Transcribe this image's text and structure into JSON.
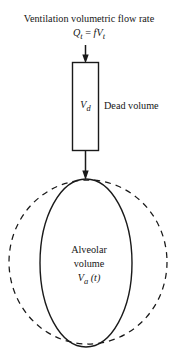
{
  "figure": {
    "title_line1": "Ventilation volumetric flow rate",
    "flow_equation": {
      "lhs_symbol": "Q",
      "lhs_subscript": "t",
      "equals": " = ",
      "rhs_freq": "f",
      "rhs_symbol": "V",
      "rhs_subscript": "t"
    },
    "dead_volume": {
      "box_symbol": "V",
      "box_subscript": "d",
      "label": "Dead volume"
    },
    "alveolar": {
      "line1": "Alveolar",
      "line2": "volume",
      "symbol": "V",
      "subscript": "a",
      "argument": " (t)"
    },
    "colors": {
      "stroke": "#1a1a1a",
      "background": "#ffffff",
      "text": "#161616"
    },
    "icons": {
      "inflow_arrow": "arrow-down-icon",
      "transfer_arrow": "arrow-down-icon",
      "dead_space_box": "rectangle-shape",
      "alveolar_solid": "ellipse-shape",
      "alveolar_dashed": "dashed-ellipse-shape"
    }
  }
}
